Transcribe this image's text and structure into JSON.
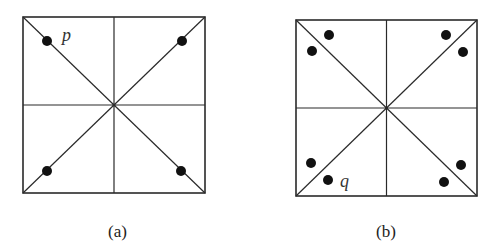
{
  "figures": [
    {
      "id": "a",
      "caption": "(a)",
      "box": {
        "x": 23,
        "y": 17,
        "w": 182,
        "h": 176
      },
      "points": [
        {
          "x": 47,
          "y": 41,
          "label": "p",
          "lx": 60,
          "ly": 41
        },
        {
          "x": 182,
          "y": 41
        },
        {
          "x": 47,
          "y": 171
        },
        {
          "x": 181,
          "y": 171
        }
      ]
    },
    {
      "id": "b",
      "caption": "(b)",
      "box": {
        "x": 296,
        "y": 20,
        "w": 181,
        "h": 176
      },
      "points": [
        {
          "x": 329,
          "y": 35
        },
        {
          "x": 312,
          "y": 51
        },
        {
          "x": 446,
          "y": 35
        },
        {
          "x": 463,
          "y": 52
        },
        {
          "x": 311,
          "y": 163
        },
        {
          "x": 328,
          "y": 180,
          "label": "q",
          "lx": 338,
          "ly": 187
        },
        {
          "x": 461,
          "y": 165
        },
        {
          "x": 444,
          "y": 182
        }
      ]
    }
  ],
  "colors": {
    "line": "#2a2a2a",
    "dot": "#111111"
  }
}
